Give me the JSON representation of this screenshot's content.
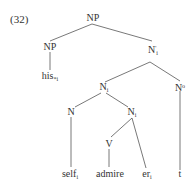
{
  "example_number": "(32)",
  "tree": {
    "root": "NP",
    "nodes": {
      "np_root": {
        "label": "NP"
      },
      "np_left": {
        "label": "NP"
      },
      "nbar": {
        "label": "N",
        "sup": "'",
        "sub": "i"
      },
      "n_i_upper": {
        "label": "N",
        "sub": "i"
      },
      "n_zero": {
        "label": "N",
        "sup": "o"
      },
      "n_left": {
        "label": "N"
      },
      "n_i_lower": {
        "label": "N",
        "sub": "i"
      },
      "v": {
        "label": "V"
      }
    },
    "leaves": {
      "his": {
        "label": "his",
        "sub": "*i"
      },
      "self": {
        "label": "self",
        "sub": "i"
      },
      "admire": {
        "label": "admire"
      },
      "er": {
        "label": "er",
        "sub": "i"
      },
      "t": {
        "label": "t"
      }
    }
  }
}
